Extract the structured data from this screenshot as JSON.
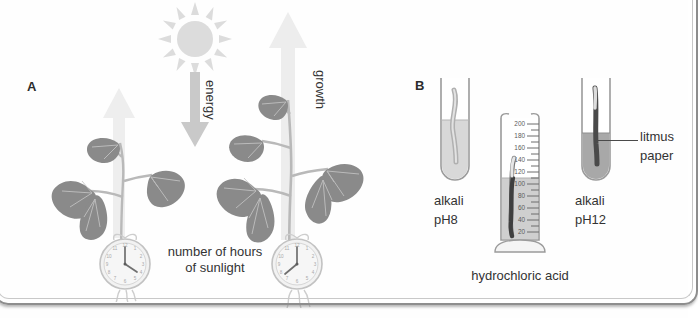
{
  "figure": {
    "type": "scientific-diagram",
    "style": "grayscale line-and-tone textbook illustration",
    "panels": [
      {
        "id": "A",
        "label": "A",
        "topic": "effect of number of hours of sunlight on plant growth"
      },
      {
        "id": "B",
        "label": "B",
        "topic": "litmus paper tested in alkali and hydrochloric acid"
      }
    ]
  },
  "panel_a": {
    "letter": "A",
    "sun": {
      "name": "sun-icon",
      "rays": 12
    },
    "energy_arrow": {
      "label": "energy",
      "direction": "down"
    },
    "growth_arrow_small": {
      "label": "",
      "direction": "up"
    },
    "growth_arrow_large": {
      "label": "growth",
      "direction": "up"
    },
    "caption": "number of hours\nof sunlight",
    "caption_line1": "number of hours",
    "caption_line2": "of sunlight",
    "clock_left": {
      "name": "clock-left",
      "hour": 12,
      "minute": 20
    },
    "clock_right": {
      "name": "clock-right",
      "hour": 12,
      "minute": 40
    },
    "plant_left": {
      "name": "plant-small",
      "leaves": 4
    },
    "plant_right": {
      "name": "plant-large",
      "leaves": 5
    }
  },
  "panel_b": {
    "letter": "B",
    "tube_left": {
      "name": "test-tube-alkali-ph8",
      "label_line1": "alkali",
      "label_line2": "pH8",
      "liquid_shade": "light",
      "paper_shade": "light"
    },
    "tube_right": {
      "name": "test-tube-alkali-ph12",
      "label_line1": "alkali",
      "label_line2": "pH12",
      "liquid_shade": "dark",
      "paper_shade": "dark"
    },
    "cylinder": {
      "name": "measuring-cylinder",
      "caption": "hydrochloric acid",
      "scale_labels": [
        200,
        180,
        160,
        140,
        120,
        100,
        80,
        60,
        40,
        20
      ],
      "scale_max": 200,
      "scale_min": 0,
      "liquid_level": 100,
      "minor_ticks_per_major": 2
    },
    "litmus_callout": {
      "line1": "litmus",
      "line2": "paper"
    }
  },
  "colors": {
    "background": "#fefefe",
    "text": "#333333",
    "frame_border": "#8d8d8d",
    "arrow_fill": "#e9e9e9",
    "arrow_energy_fill": "#c9c9c9",
    "sun_fill": "#d8d8d8",
    "leaf_dark": "#7c7c7c",
    "leaf_mid": "#9a9a9a",
    "stem": "#cfcfcf",
    "glass_stroke": "#9b9b9b",
    "liquid_light": "#d6d6d6",
    "liquid_dark": "#9e9e9e",
    "paper_dark": "#4f4f4f",
    "clock_face": "#efefef"
  }
}
